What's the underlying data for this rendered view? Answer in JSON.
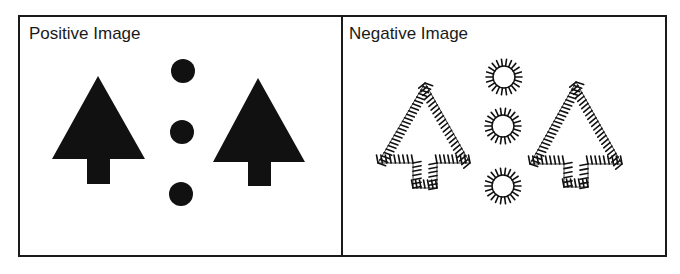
{
  "panels": {
    "positive": {
      "title": "Positive Image",
      "fill_color": "#111111",
      "trees": [
        {
          "apex": [
            98,
            76
          ],
          "base_y": 159,
          "base_left": 52,
          "base_right": 145,
          "trunk": {
            "x": 87,
            "w": 23,
            "bottom": 184
          }
        },
        {
          "apex": [
            258,
            78
          ],
          "base_y": 162,
          "base_left": 213,
          "base_right": 305,
          "trunk": {
            "x": 248,
            "w": 23,
            "bottom": 186
          }
        }
      ],
      "dots": [
        {
          "cx": 183,
          "cy": 71,
          "r": 12
        },
        {
          "cx": 182,
          "cy": 132,
          "r": 12
        },
        {
          "cx": 181,
          "cy": 194,
          "r": 12
        }
      ]
    },
    "negative": {
      "title": "Negative Image",
      "stroke_color": "#111111",
      "trees": [
        {
          "apex": [
            425,
            83
          ],
          "base_y": 163,
          "base_left": 378,
          "base_right": 470,
          "trunk": {
            "x": 413,
            "w": 24,
            "bottom": 188
          }
        },
        {
          "apex": [
            576,
            82
          ],
          "base_y": 164,
          "base_left": 530,
          "base_right": 622,
          "trunk": {
            "x": 564,
            "w": 24,
            "bottom": 187
          }
        }
      ],
      "suns": [
        {
          "cx": 504,
          "cy": 77,
          "r": 11
        },
        {
          "cx": 503,
          "cy": 126,
          "r": 11
        },
        {
          "cx": 503,
          "cy": 186,
          "r": 11
        }
      ]
    }
  }
}
